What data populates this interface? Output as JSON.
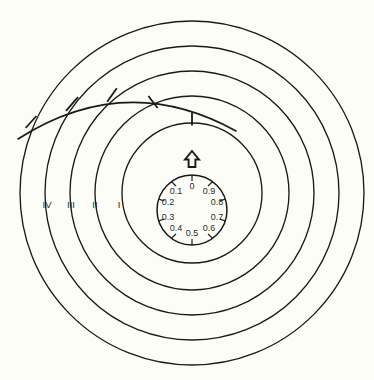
{
  "figure": {
    "name": "concentric-ring-dial-diagram",
    "background_color": "#fdfdf7",
    "stroke_color": "#1a1a1a",
    "center": {
      "x": 192,
      "y": 193
    }
  },
  "rings": [
    {
      "id": "ring-outer-5",
      "radius": 172,
      "zone_label": ""
    },
    {
      "id": "ring-4",
      "radius": 147,
      "zone_label": "IV"
    },
    {
      "id": "ring-3",
      "radius": 122,
      "zone_label": "III"
    },
    {
      "id": "ring-2",
      "radius": 97,
      "zone_label": "II"
    },
    {
      "id": "ring-1",
      "radius": 70,
      "zone_label": "I"
    }
  ],
  "zone_labels": [
    {
      "text": "IV",
      "x": 47,
      "y": 205
    },
    {
      "text": "III",
      "x": 71,
      "y": 205
    },
    {
      "text": "II",
      "x": 95,
      "y": 205
    },
    {
      "text": "I",
      "x": 119,
      "y": 205
    }
  ],
  "dial": {
    "name": "decimal-dial",
    "center": {
      "x": 192,
      "y": 210
    },
    "radius": 35,
    "label_radius": 26,
    "labels": [
      {
        "text": "0",
        "angle_deg": 0,
        "x": 192,
        "y": 186
      },
      {
        "text": "0.1",
        "angle_deg": -36,
        "x": 176,
        "y": 191
      },
      {
        "text": "0.2",
        "angle_deg": -72,
        "x": 167,
        "y": 202
      },
      {
        "text": "0.3",
        "angle_deg": -108,
        "x": 167,
        "y": 218
      },
      {
        "text": "0.4",
        "angle_deg": -144,
        "x": 176,
        "y": 230
      },
      {
        "text": "0.5",
        "angle_deg": 180,
        "x": 192,
        "y": 235
      },
      {
        "text": "0.6",
        "angle_deg": 144,
        "x": 209,
        "y": 230
      },
      {
        "text": "0.7",
        "angle_deg": 108,
        "x": 218,
        "y": 218
      },
      {
        "text": "0.8",
        "angle_deg": 72,
        "x": 218,
        "y": 202
      },
      {
        "text": "0.9",
        "angle_deg": 36,
        "x": 209,
        "y": 191
      }
    ]
  },
  "pointer": {
    "name": "dial-index-arrow",
    "direction": "up",
    "x": 192,
    "y": 160
  },
  "sweep": {
    "name": "sweep-arc",
    "description": "arc crossing all rings with tick marks at each intersection",
    "path": "M 18 139 Q 125 72 236 131",
    "ticks": [
      {
        "x": 31,
        "y": 122,
        "angle_deg": 58
      },
      {
        "x": 72,
        "y": 104,
        "angle_deg": 42
      },
      {
        "x": 112,
        "y": 95,
        "angle_deg": 20
      },
      {
        "x": 153,
        "y": 102,
        "angle_deg": -18
      },
      {
        "x": 192,
        "y": 119,
        "angle_deg": -2
      }
    ],
    "tick_length": 13
  }
}
